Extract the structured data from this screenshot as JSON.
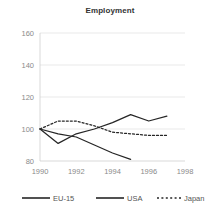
{
  "chart_data": {
    "type": "line",
    "title": "Employment",
    "xlabel": "",
    "ylabel": "",
    "xlim": [
      1990,
      1998
    ],
    "ylim": [
      80,
      160
    ],
    "grid": true,
    "legend_position": "bottom",
    "x": [
      1990,
      1991,
      1992,
      1993,
      1994,
      1995,
      1996,
      1997
    ],
    "xticks": [
      "1990",
      "1992",
      "1994",
      "1996",
      "1998"
    ],
    "xtick_values": [
      1990,
      1992,
      1994,
      1996,
      1998
    ],
    "yticks": [
      "80",
      "100",
      "120",
      "140",
      "160"
    ],
    "ytick_values": [
      80,
      100,
      120,
      140,
      160
    ],
    "series": [
      {
        "name": "EU-15",
        "style": "solid",
        "x": [
          1990,
          1991,
          1992,
          1993,
          1994,
          1995
        ],
        "values": [
          100,
          97,
          95,
          90,
          85,
          81
        ]
      },
      {
        "name": "USA",
        "style": "solid",
        "x": [
          1990,
          1991,
          1992,
          1993,
          1994,
          1995,
          1996,
          1997
        ],
        "values": [
          100,
          91,
          97,
          100,
          104,
          109,
          105,
          108
        ]
      },
      {
        "name": "Japan",
        "style": "dotted",
        "x": [
          1990,
          1991,
          1992,
          1993,
          1994,
          1995,
          1996,
          1997
        ],
        "values": [
          100,
          105,
          105,
          102,
          98,
          97,
          96,
          96
        ]
      }
    ]
  },
  "legend": {
    "items": [
      {
        "label": "EU-15",
        "style": "solid"
      },
      {
        "label": "USA",
        "style": "solid"
      },
      {
        "label": "Japan",
        "style": "dotted"
      }
    ]
  },
  "colors": {
    "line": "#262626",
    "grid": "#e3e3e3",
    "tick_text": "#8a8a8a",
    "title_text": "#333333",
    "legend_text": "#555555",
    "background": "#ffffff"
  }
}
